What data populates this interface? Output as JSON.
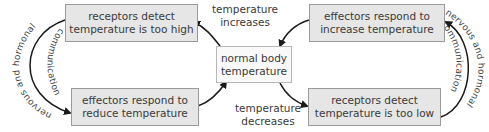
{
  "diagram": {
    "title": "",
    "nodes": {
      "center": {
        "line1": "normal body",
        "line2": "temperature"
      },
      "top_left": {
        "line1": "receptors detect",
        "line2": "temperature is too high"
      },
      "bottom_left": {
        "line1": "effectors respond to",
        "line2": "reduce temperature"
      },
      "top_right": {
        "line1": "effectors respond to",
        "line2": "increase temperature"
      },
      "bottom_right": {
        "line1": "receptors detect",
        "line2": "temperature is too low"
      }
    },
    "edge_labels": {
      "increases": {
        "line1": "temperature",
        "line2": "increases"
      },
      "decreases": {
        "line1": "temperature",
        "line2": "decreases"
      },
      "left_outer": "nervous and hormonal",
      "left_inner": "communication",
      "right_outer": "nervous and hormonal",
      "right_inner": "communication"
    },
    "colors": {
      "box_fill": "#e6e6e6",
      "box_border": "#9a9a9a",
      "arrow": "#1a1a1a",
      "text": "#3a3a3a"
    }
  }
}
